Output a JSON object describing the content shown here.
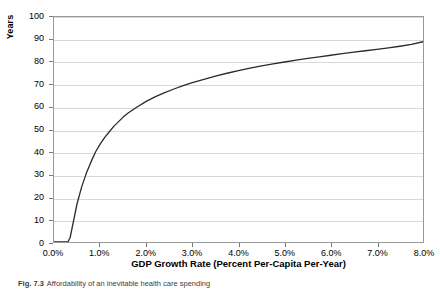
{
  "chart_data": {
    "type": "line",
    "title": "",
    "xlabel": "GDP Growth Rate (Percent Per-Capita Per-Year)",
    "ylabel": "Years",
    "xlim": [
      0.0,
      8.0
    ],
    "ylim": [
      0,
      100
    ],
    "grid": "horizontal",
    "legend": "none",
    "line_color": "#2b2b2b",
    "x_tick_labels": [
      "0.0%",
      "1.0%",
      "2.0%",
      "3.0%",
      "4.0%",
      "5.0%",
      "6.0%",
      "7.0%",
      "8.0%"
    ],
    "x_tick_values": [
      0.0,
      1.0,
      2.0,
      3.0,
      4.0,
      5.0,
      6.0,
      7.0,
      8.0
    ],
    "y_tick_labels": [
      "0",
      "10",
      "20",
      "30",
      "40",
      "50",
      "60",
      "70",
      "80",
      "90",
      "100"
    ],
    "y_tick_values": [
      0,
      10,
      20,
      30,
      40,
      50,
      60,
      70,
      80,
      90,
      100
    ],
    "series": [
      {
        "name": "Years to afford",
        "x": [
          0.0,
          0.1,
          0.2,
          0.3,
          0.35,
          0.4,
          0.45,
          0.5,
          0.6,
          0.7,
          0.8,
          0.9,
          1.0,
          1.1,
          1.2,
          1.3,
          1.4,
          1.5,
          1.6,
          1.8,
          2.0,
          2.2,
          2.4,
          2.6,
          2.8,
          3.0,
          3.25,
          3.5,
          3.75,
          4.0,
          4.25,
          4.5,
          4.75,
          5.0,
          5.25,
          5.5,
          5.75,
          6.0,
          6.25,
          6.5,
          6.75,
          7.0,
          7.25,
          7.5,
          7.75,
          8.0
        ],
        "y": [
          0.0,
          0.0,
          0.0,
          0.0,
          2.0,
          7.0,
          12.0,
          17.0,
          24.5,
          30.5,
          35.5,
          40.0,
          43.5,
          46.5,
          49.0,
          51.5,
          53.5,
          55.5,
          57.2,
          60.0,
          62.5,
          64.6,
          66.4,
          68.0,
          69.5,
          70.8,
          72.3,
          73.7,
          75.0,
          76.2,
          77.3,
          78.3,
          79.2,
          80.0,
          80.8,
          81.6,
          82.3,
          83.0,
          83.7,
          84.4,
          85.0,
          85.6,
          86.3,
          87.0,
          87.8,
          89.0
        ]
      }
    ]
  },
  "caption": {
    "label": "Fig. 7.3",
    "text": "Affordability of an inevitable health care spending"
  }
}
